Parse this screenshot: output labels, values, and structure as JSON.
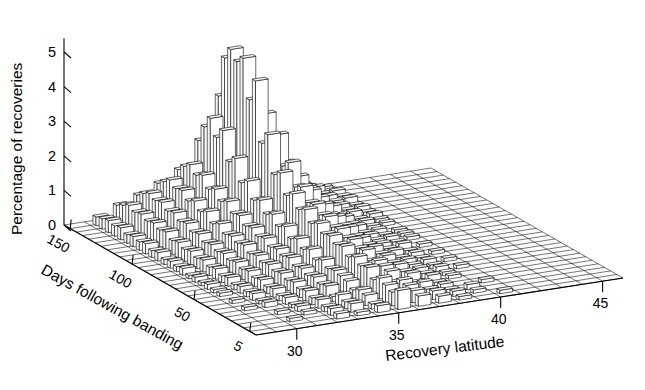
{
  "figure": {
    "background": "#ffffff",
    "line_color": "#000000",
    "bar_fill": "#ffffff"
  },
  "chart_data": {
    "type": "bar",
    "projection": "3d-surface-bars",
    "title": "",
    "xlabel": "Recovery latitude",
    "ylabel": "Days following banding",
    "zlabel": "Percentage of recoveries",
    "xlim": [
      28,
      46
    ],
    "ylim": [
      0,
      155
    ],
    "zlim": [
      0,
      5.4
    ],
    "xticks": [
      30,
      35,
      40,
      45
    ],
    "yticks": [
      5,
      50,
      100,
      150
    ],
    "zticks": [
      0,
      1,
      2,
      3,
      4,
      5
    ],
    "xticklabels": [
      "30",
      "35",
      "40",
      "45"
    ],
    "yticklabels": [
      "5",
      "50",
      "100",
      "150"
    ],
    "zticklabels": [
      "0",
      "1",
      "2",
      "3",
      "4",
      "5"
    ],
    "grid": true,
    "legend": "none",
    "x_bin_width": 1,
    "y_bin_width": 5,
    "x_bins": [
      28.5,
      29.5,
      30.5,
      31.5,
      32.5,
      33.5,
      34.5,
      35.5,
      36.5,
      37.5,
      38.5,
      39.5,
      40.5,
      41.5,
      42.5,
      43.5,
      44.5
    ],
    "y_bins": [
      5,
      10,
      15,
      20,
      25,
      30,
      35,
      40,
      45,
      50,
      55,
      60,
      65,
      70,
      75,
      80,
      85,
      90,
      95,
      100,
      105,
      110,
      115,
      120,
      125,
      130,
      135,
      140,
      145,
      150
    ],
    "values": [
      [
        0,
        0,
        0,
        0,
        0.15,
        0.1,
        0.2,
        0.55,
        0.3,
        0.2,
        0.1,
        0,
        0.1,
        0,
        0,
        0,
        0
      ],
      [
        0,
        0,
        0.1,
        0,
        0.2,
        0.25,
        0.15,
        0.4,
        0.35,
        0.25,
        0.15,
        0.1,
        0,
        0,
        0,
        0,
        0
      ],
      [
        0,
        0,
        0,
        0.1,
        0.15,
        0.2,
        0.3,
        0.5,
        0.4,
        0.2,
        0.1,
        0.15,
        0,
        0,
        0,
        0,
        0
      ],
      [
        0,
        0,
        0.1,
        0.15,
        0.25,
        0.3,
        0.35,
        0.6,
        0.45,
        0.3,
        0.15,
        0,
        0.1,
        0,
        0,
        0,
        0
      ],
      [
        0,
        0,
        0,
        0.1,
        0.2,
        0.15,
        0.25,
        0.45,
        0.3,
        0.2,
        0.1,
        0,
        0,
        0,
        0,
        0,
        0
      ],
      [
        0,
        0.1,
        0.15,
        0.2,
        0.3,
        0.35,
        0.4,
        0.7,
        0.5,
        0.35,
        0.2,
        0.1,
        0,
        0,
        0,
        0,
        0
      ],
      [
        0,
        0,
        0.1,
        0.15,
        0.25,
        0.3,
        0.45,
        0.65,
        0.55,
        0.3,
        0.15,
        0.1,
        0,
        0,
        0,
        0,
        0
      ],
      [
        0,
        0.1,
        0.2,
        0.25,
        0.35,
        0.4,
        0.5,
        0.8,
        0.6,
        0.4,
        0.2,
        0.15,
        0.1,
        0,
        0,
        0,
        0
      ],
      [
        0,
        0,
        0.15,
        0.2,
        0.3,
        0.35,
        0.45,
        0.7,
        0.5,
        0.35,
        0.2,
        0.1,
        0,
        0,
        0,
        0,
        0
      ],
      [
        0,
        0.1,
        0.2,
        0.3,
        0.4,
        0.45,
        0.6,
        0.9,
        0.7,
        0.45,
        0.25,
        0.15,
        0.1,
        0,
        0,
        0,
        0
      ],
      [
        0,
        0.1,
        0.15,
        0.25,
        0.35,
        0.4,
        0.5,
        0.85,
        0.65,
        0.4,
        0.2,
        0.1,
        0,
        0,
        0,
        0,
        0
      ],
      [
        0,
        0.15,
        0.25,
        0.35,
        0.45,
        0.55,
        0.7,
        1.0,
        0.8,
        0.5,
        0.3,
        0.15,
        0.1,
        0,
        0,
        0,
        0
      ],
      [
        0,
        0.1,
        0.2,
        0.3,
        0.4,
        0.5,
        0.6,
        0.95,
        0.75,
        0.45,
        0.25,
        0.1,
        0,
        0,
        0,
        0,
        0
      ],
      [
        0,
        0.15,
        0.3,
        0.4,
        0.5,
        0.6,
        0.8,
        1.15,
        0.9,
        0.55,
        0.3,
        0.2,
        0.1,
        0,
        0,
        0,
        0
      ],
      [
        0,
        0.1,
        0.25,
        0.35,
        0.45,
        0.55,
        0.7,
        1.05,
        0.85,
        0.5,
        0.3,
        0.15,
        0,
        0,
        0,
        0,
        0
      ],
      [
        0,
        0.2,
        0.35,
        0.45,
        0.6,
        0.7,
        0.95,
        1.35,
        1.05,
        0.65,
        0.35,
        0.2,
        0.1,
        0,
        0,
        0,
        0
      ],
      [
        0,
        0.15,
        0.3,
        0.4,
        0.55,
        0.65,
        0.85,
        1.25,
        1.0,
        0.6,
        0.3,
        0.15,
        0.1,
        0,
        0,
        0,
        0
      ],
      [
        0,
        0.2,
        0.4,
        0.5,
        0.65,
        0.8,
        1.1,
        1.6,
        1.2,
        0.75,
        0.4,
        0.2,
        0.1,
        0,
        0,
        0,
        0
      ],
      [
        0,
        0.15,
        0.35,
        0.45,
        0.6,
        0.75,
        1.0,
        1.45,
        1.15,
        0.7,
        0.35,
        0.2,
        0,
        0,
        0,
        0,
        0
      ],
      [
        0,
        0.25,
        0.45,
        0.6,
        0.8,
        0.95,
        1.3,
        2.0,
        1.5,
        0.9,
        0.45,
        0.25,
        0.1,
        0,
        0,
        0,
        0
      ],
      [
        0,
        0.2,
        0.4,
        0.55,
        0.7,
        0.9,
        1.2,
        1.85,
        1.4,
        0.8,
        0.4,
        0.2,
        0.1,
        0,
        0,
        0,
        0
      ],
      [
        0,
        0.3,
        0.55,
        0.7,
        0.95,
        1.15,
        1.65,
        2.9,
        2.0,
        1.1,
        0.55,
        0.3,
        0.15,
        0,
        0,
        0,
        0
      ],
      [
        0,
        0.25,
        0.5,
        0.65,
        0.85,
        1.05,
        1.5,
        2.55,
        1.8,
        1.0,
        0.5,
        0.25,
        0.1,
        0,
        0,
        0,
        0
      ],
      [
        0,
        0.3,
        0.6,
        0.8,
        1.05,
        1.3,
        2.1,
        4.25,
        2.6,
        1.3,
        0.6,
        0.3,
        0.15,
        0,
        0,
        0,
        0
      ],
      [
        0,
        0.25,
        0.55,
        0.75,
        0.95,
        1.2,
        1.9,
        3.6,
        2.3,
        1.15,
        0.55,
        0.3,
        0.1,
        0,
        0,
        0,
        0
      ],
      [
        0,
        0.35,
        0.65,
        0.9,
        1.15,
        1.5,
        2.7,
        4.7,
        3.0,
        1.5,
        0.7,
        0.35,
        0.2,
        0,
        0,
        0,
        0
      ],
      [
        0,
        0.3,
        0.6,
        0.85,
        1.1,
        1.4,
        2.4,
        4.5,
        2.8,
        1.35,
        0.65,
        0.3,
        0.15,
        0,
        0,
        0,
        0
      ],
      [
        0,
        0.35,
        0.7,
        0.95,
        1.25,
        1.6,
        2.85,
        4.75,
        3.1,
        1.55,
        0.75,
        0.4,
        0.2,
        0,
        0,
        0,
        0
      ],
      [
        0,
        0.3,
        0.6,
        0.85,
        1.1,
        1.45,
        2.5,
        4.4,
        2.75,
        1.3,
        0.6,
        0.3,
        0.1,
        0,
        0,
        0,
        0
      ],
      [
        0,
        0.25,
        0.5,
        0.7,
        0.95,
        1.25,
        2.0,
        3.2,
        2.1,
        1.05,
        0.5,
        0.25,
        0.1,
        0,
        0,
        0,
        0
      ]
    ]
  },
  "axes": {
    "x_axis": {
      "name": "Recovery latitude",
      "ticks": [
        "30",
        "35",
        "40",
        "45"
      ]
    },
    "y_axis": {
      "name": "Days following banding",
      "ticks": [
        "5",
        "50",
        "100",
        "150"
      ]
    },
    "z_axis": {
      "name": "Percentage of recoveries",
      "ticks": [
        "0",
        "1",
        "2",
        "3",
        "4",
        "5"
      ]
    }
  }
}
